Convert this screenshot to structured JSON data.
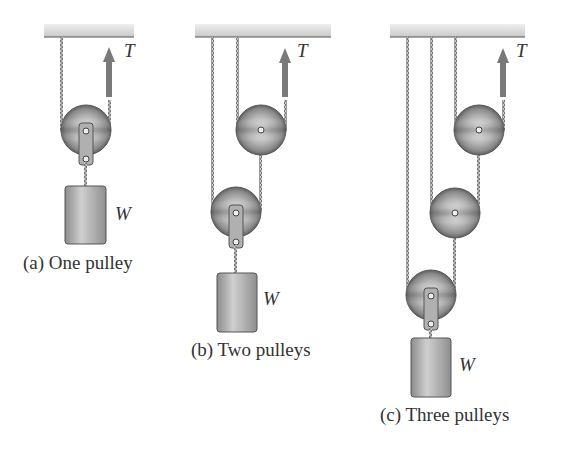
{
  "figure": {
    "colors": {
      "ceiling": "#d6d6d6",
      "rope": "#8a8a8a",
      "pulley": "#9a9a9a",
      "arrow": "#7a7a7a",
      "weight": "#a8a8a8",
      "text": "#333333"
    },
    "panels": [
      {
        "id": "a",
        "caption": "(a) One pulley",
        "tension_label": "T",
        "weight_label": "W",
        "pulley_count": 1
      },
      {
        "id": "b",
        "caption": "(b) Two pulleys",
        "tension_label": "T",
        "weight_label": "W",
        "pulley_count": 2
      },
      {
        "id": "c",
        "caption": "(c) Three pulleys",
        "tension_label": "T",
        "weight_label": "W",
        "pulley_count": 3
      }
    ]
  }
}
